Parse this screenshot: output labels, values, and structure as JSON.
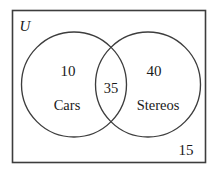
{
  "figure": {
    "type": "venn-diagram",
    "universe_label": "U",
    "outside_count": "15",
    "sets": [
      {
        "name": "Cars",
        "only_count": "10"
      },
      {
        "name": "Stereos",
        "only_count": "40"
      }
    ],
    "intersection_count": "35",
    "colors": {
      "background": "#ffffff",
      "stroke": "#3d3d3d",
      "text": "#1a1a1a"
    }
  }
}
